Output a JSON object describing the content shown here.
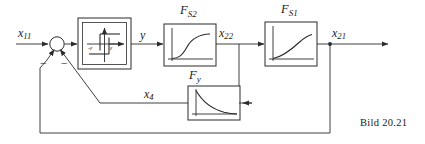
{
  "figure": {
    "caption": "Bild 20.21",
    "type": "control-block-diagram"
  },
  "signals": {
    "input": {
      "name": "x",
      "sub": "11"
    },
    "hysteresis_out": {
      "name": "y",
      "sub": ""
    },
    "fs2_out": {
      "name": "x",
      "sub": "22"
    },
    "fs1_out": {
      "name": "x",
      "sub": "21"
    },
    "fy_out": {
      "name": "x",
      "sub": "4"
    }
  },
  "blocks": {
    "hysteresis": {
      "label": "",
      "neg_eps": "-ε",
      "pos_eps": "ε",
      "curve": "three-position-relay-with-hysteresis"
    },
    "fs2": {
      "name": "F",
      "sub": "S2",
      "curve": "saturating-s-curve"
    },
    "fs1": {
      "name": "F",
      "sub": "S1",
      "curve": "rising-saturating-curve"
    },
    "fy": {
      "name": "F",
      "sub": "y",
      "curve": "decaying-exponential"
    }
  },
  "summing_junction": {
    "sign_left": "",
    "sign_inner_feedback": "−",
    "sign_outer_feedback": "−"
  },
  "colors": {
    "line": "#2b2b2b",
    "curve": "#2b2b2b",
    "background": "#ffffff",
    "text": "#1a1a1a"
  }
}
